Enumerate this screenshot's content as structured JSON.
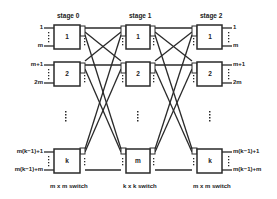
{
  "diagram": {
    "type": "three-stage Clos switching network",
    "colors": {
      "line": "#2a2a2a",
      "box_fill": "#ffffff",
      "background": "#ffffff"
    },
    "stages": [
      {
        "title": "stage 0",
        "switch_label": "m x m  switch",
        "boxes": [
          "1",
          "2",
          "k"
        ]
      },
      {
        "title": "stage 1",
        "switch_label": "k x k  switch",
        "boxes": [
          "1",
          "2",
          "m"
        ]
      },
      {
        "title": "stage 2",
        "switch_label": "m x m  switch",
        "boxes": [
          "1",
          "2",
          "k"
        ]
      }
    ],
    "inputs": {
      "box1": [
        "1",
        "m"
      ],
      "box2": [
        "m+1",
        "2m"
      ],
      "boxk": [
        "m(k−1)+1",
        "m(k−1)+m"
      ]
    },
    "outputs": {
      "box1": [
        "1",
        "m"
      ],
      "box2": [
        "m+1",
        "2m"
      ],
      "boxk": [
        "m(k−1)+1",
        "m(k−1)+m"
      ]
    },
    "ellipsis": "⋮"
  }
}
